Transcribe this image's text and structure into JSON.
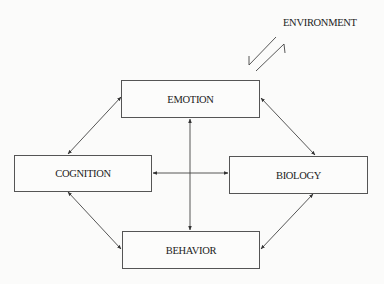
{
  "diagram": {
    "type": "biopsychosocial-interaction-model",
    "environment": {
      "label": "ENVIRONMENT"
    },
    "nodes": [
      {
        "id": "emotion",
        "label": "EMOTION",
        "x": 121,
        "y": 80,
        "w": 139,
        "h": 38
      },
      {
        "id": "cognition",
        "label": "COGNITION",
        "x": 14,
        "y": 155,
        "w": 138,
        "h": 37
      },
      {
        "id": "biology",
        "label": "BIOLOGY",
        "x": 229,
        "y": 156,
        "w": 139,
        "h": 38
      },
      {
        "id": "behavior",
        "label": "BEHAVIOR",
        "x": 122,
        "y": 231,
        "w": 138,
        "h": 38
      }
    ],
    "edges": [
      {
        "from": "cognition",
        "to": "emotion",
        "direction": "bidirectional"
      },
      {
        "from": "emotion",
        "to": "biology",
        "direction": "bidirectional"
      },
      {
        "from": "cognition",
        "to": "behavior",
        "direction": "bidirectional"
      },
      {
        "from": "biology",
        "to": "behavior",
        "direction": "bidirectional"
      },
      {
        "from": "emotion",
        "to": "behavior",
        "direction": "bidirectional"
      },
      {
        "from": "cognition",
        "to": "biology",
        "direction": "bidirectional"
      },
      {
        "from": "environment",
        "to": "system",
        "direction": "bidirectional-half-arrows"
      }
    ],
    "colors": {
      "line": "#444444",
      "text": "#222222",
      "background": "#fbfbfa"
    }
  }
}
